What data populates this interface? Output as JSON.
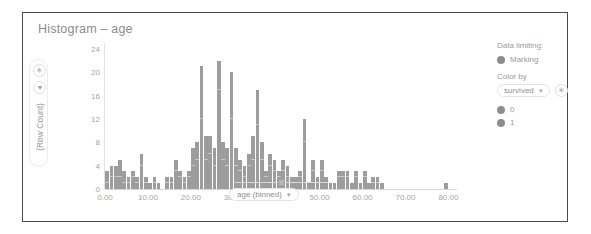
{
  "card": {
    "title": "Histogram – age"
  },
  "y_control": {
    "buttons": [
      {
        "name": "y-axis-settings-button",
        "glyph": "✳"
      },
      {
        "name": "y-axis-dropdown-button",
        "glyph": "▾"
      }
    ],
    "label": "(Row Count)"
  },
  "x_control": {
    "slider_value": 50,
    "pill_label": "age (binned)",
    "caret": "▾"
  },
  "legend": {
    "data_limiting_label": "Data limiting:",
    "marking_label": "Marking",
    "color_by_label": "Color by",
    "color_by_value": "survived",
    "color_by_caret": "▾",
    "settings_glyph": "✳",
    "values": [
      {
        "label": "0",
        "color": "#8d8d8d"
      },
      {
        "label": "1",
        "color": "#8d8d8d"
      }
    ]
  },
  "colors": {
    "bar": "#9d9d9d",
    "segment_line": "#c8c8c8",
    "axis": "#d8d8d8",
    "text": "#9a9a9a",
    "border": "#4a4a4a"
  },
  "chart_data": {
    "type": "bar",
    "title": "Histogram – age",
    "xlabel": "age (binned)",
    "ylabel": "(Row Count)",
    "xlim": [
      0,
      82
    ],
    "ylim": [
      0,
      25
    ],
    "ytick_labels": [
      "0",
      "4",
      "8",
      "12",
      "16",
      "20",
      "24"
    ],
    "ytick_values": [
      0,
      4,
      8,
      12,
      16,
      20,
      24
    ],
    "xtick_labels": [
      "0.00",
      "10.00",
      "20.00",
      "30.00",
      "40.00",
      "50.00",
      "60.00",
      "70.00",
      "80.00"
    ],
    "xtick_values": [
      0,
      10,
      20,
      30,
      40,
      50,
      60,
      70,
      80
    ],
    "grid": false,
    "legend_position": "right",
    "stacked": true,
    "series": [
      {
        "name": "0",
        "color": "#9d9d9d"
      },
      {
        "name": "1",
        "color": "#9d9d9d"
      }
    ],
    "bin_width": 1,
    "bins": [
      {
        "x": 0.5,
        "total": 3,
        "seg0": 1,
        "seg1": 2
      },
      {
        "x": 1.5,
        "total": 4,
        "seg0": 2,
        "seg1": 2
      },
      {
        "x": 2.5,
        "total": 4,
        "seg0": 2,
        "seg1": 2
      },
      {
        "x": 3.5,
        "total": 5,
        "seg0": 2,
        "seg1": 3
      },
      {
        "x": 4.5,
        "total": 3,
        "seg0": 1,
        "seg1": 2
      },
      {
        "x": 5.5,
        "total": 2,
        "seg0": 1,
        "seg1": 1
      },
      {
        "x": 6.5,
        "total": 3,
        "seg0": 2,
        "seg1": 1
      },
      {
        "x": 7.5,
        "total": 2,
        "seg0": 1,
        "seg1": 1
      },
      {
        "x": 8.5,
        "total": 6,
        "seg0": 4,
        "seg1": 2
      },
      {
        "x": 9.5,
        "total": 2,
        "seg0": 1,
        "seg1": 1
      },
      {
        "x": 10.5,
        "total": 1,
        "seg0": 1,
        "seg1": 0
      },
      {
        "x": 11.5,
        "total": 2,
        "seg0": 1,
        "seg1": 1
      },
      {
        "x": 12.5,
        "total": 1,
        "seg0": 1,
        "seg1": 0
      },
      {
        "x": 13.5,
        "total": 0,
        "seg0": 0,
        "seg1": 0
      },
      {
        "x": 14.5,
        "total": 2,
        "seg0": 1,
        "seg1": 1
      },
      {
        "x": 15.5,
        "total": 2,
        "seg0": 1,
        "seg1": 1
      },
      {
        "x": 16.5,
        "total": 5,
        "seg0": 3,
        "seg1": 2
      },
      {
        "x": 17.5,
        "total": 3,
        "seg0": 2,
        "seg1": 1
      },
      {
        "x": 18.5,
        "total": 2,
        "seg0": 1,
        "seg1": 1
      },
      {
        "x": 19.5,
        "total": 3,
        "seg0": 2,
        "seg1": 1
      },
      {
        "x": 20.5,
        "total": 7,
        "seg0": 4,
        "seg1": 3
      },
      {
        "x": 21.5,
        "total": 8,
        "seg0": 5,
        "seg1": 3
      },
      {
        "x": 22.5,
        "total": 21,
        "seg0": 12,
        "seg1": 9
      },
      {
        "x": 23.5,
        "total": 9,
        "seg0": 5,
        "seg1": 4
      },
      {
        "x": 24.5,
        "total": 9,
        "seg0": 6,
        "seg1": 3
      },
      {
        "x": 25.5,
        "total": 7,
        "seg0": 4,
        "seg1": 3
      },
      {
        "x": 26.5,
        "total": 22,
        "seg0": 17,
        "seg1": 5
      },
      {
        "x": 27.5,
        "total": 8,
        "seg0": 5,
        "seg1": 3
      },
      {
        "x": 28.5,
        "total": 7,
        "seg0": 4,
        "seg1": 3
      },
      {
        "x": 29.5,
        "total": 20,
        "seg0": 12,
        "seg1": 8
      },
      {
        "x": 30.5,
        "total": 7,
        "seg0": 4,
        "seg1": 3
      },
      {
        "x": 31.5,
        "total": 5,
        "seg0": 3,
        "seg1": 2
      },
      {
        "x": 32.5,
        "total": 4,
        "seg0": 2,
        "seg1": 2
      },
      {
        "x": 33.5,
        "total": 6,
        "seg0": 4,
        "seg1": 2
      },
      {
        "x": 34.5,
        "total": 9,
        "seg0": 5,
        "seg1": 4
      },
      {
        "x": 35.5,
        "total": 17,
        "seg0": 11,
        "seg1": 6
      },
      {
        "x": 36.5,
        "total": 8,
        "seg0": 5,
        "seg1": 3
      },
      {
        "x": 37.5,
        "total": 3,
        "seg0": 2,
        "seg1": 1
      },
      {
        "x": 38.5,
        "total": 6,
        "seg0": 4,
        "seg1": 2
      },
      {
        "x": 39.5,
        "total": 5,
        "seg0": 3,
        "seg1": 2
      },
      {
        "x": 40.5,
        "total": 3,
        "seg0": 2,
        "seg1": 1
      },
      {
        "x": 41.5,
        "total": 5,
        "seg0": 3,
        "seg1": 2
      },
      {
        "x": 42.5,
        "total": 4,
        "seg0": 2,
        "seg1": 2
      },
      {
        "x": 43.5,
        "total": 2,
        "seg0": 1,
        "seg1": 1
      },
      {
        "x": 44.5,
        "total": 2,
        "seg0": 1,
        "seg1": 1
      },
      {
        "x": 45.5,
        "total": 3,
        "seg0": 2,
        "seg1": 1
      },
      {
        "x": 46.5,
        "total": 12,
        "seg0": 8,
        "seg1": 4
      },
      {
        "x": 47.5,
        "total": 1,
        "seg0": 1,
        "seg1": 0
      },
      {
        "x": 48.5,
        "total": 5,
        "seg0": 3,
        "seg1": 2
      },
      {
        "x": 49.5,
        "total": 2,
        "seg0": 1,
        "seg1": 1
      },
      {
        "x": 50.5,
        "total": 5,
        "seg0": 3,
        "seg1": 2
      },
      {
        "x": 51.5,
        "total": 2,
        "seg0": 1,
        "seg1": 1
      },
      {
        "x": 52.5,
        "total": 1,
        "seg0": 1,
        "seg1": 0
      },
      {
        "x": 53.5,
        "total": 1,
        "seg0": 1,
        "seg1": 0
      },
      {
        "x": 54.5,
        "total": 3,
        "seg0": 2,
        "seg1": 1
      },
      {
        "x": 55.5,
        "total": 3,
        "seg0": 2,
        "seg1": 1
      },
      {
        "x": 56.5,
        "total": 3,
        "seg0": 2,
        "seg1": 1
      },
      {
        "x": 57.5,
        "total": 1,
        "seg0": 1,
        "seg1": 0
      },
      {
        "x": 58.5,
        "total": 3,
        "seg0": 2,
        "seg1": 1
      },
      {
        "x": 59.5,
        "total": 1,
        "seg0": 1,
        "seg1": 0
      },
      {
        "x": 60.5,
        "total": 3,
        "seg0": 2,
        "seg1": 1
      },
      {
        "x": 61.5,
        "total": 1,
        "seg0": 1,
        "seg1": 0
      },
      {
        "x": 62.5,
        "total": 2,
        "seg0": 1,
        "seg1": 1
      },
      {
        "x": 63.5,
        "total": 2,
        "seg0": 1,
        "seg1": 1
      },
      {
        "x": 64.5,
        "total": 1,
        "seg0": 1,
        "seg1": 0
      },
      {
        "x": 70.5,
        "total": 0,
        "seg0": 0,
        "seg1": 0
      },
      {
        "x": 79.5,
        "total": 1,
        "seg0": 1,
        "seg1": 0
      }
    ]
  }
}
